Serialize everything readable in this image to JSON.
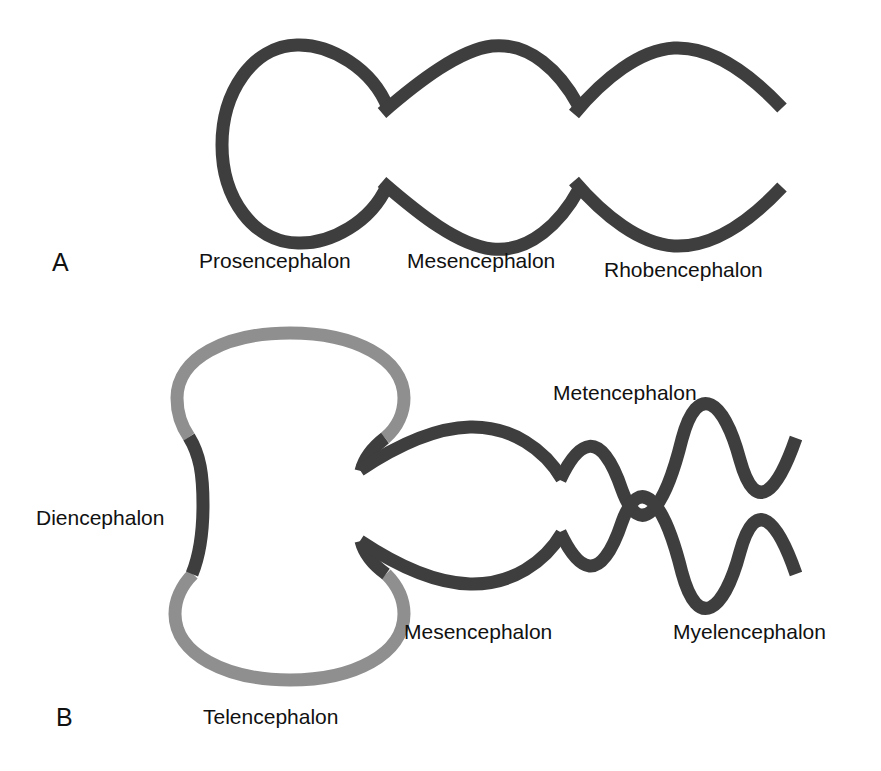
{
  "figure": {
    "background_color": "#ffffff",
    "title_visible": false
  },
  "colors": {
    "dark_stroke": "#3e3e3e",
    "light_stroke": "#8f8f8f",
    "text": "#111111"
  },
  "panels": [
    {
      "letter": "A",
      "letter_x": 52,
      "letter_y": 271,
      "stage": "three-vesicle stage",
      "labels": [
        {
          "text": "Prosencephalon",
          "x": 199,
          "y": 268,
          "color": "#111111"
        },
        {
          "text": "Mesencephalon",
          "x": 407,
          "y": 268,
          "color": "#111111"
        },
        {
          "text": "Rhobencephalon",
          "x": 604,
          "y": 277,
          "color": "#111111"
        }
      ]
    },
    {
      "letter": "B",
      "letter_x": 56,
      "letter_y": 726,
      "stage": "five-vesicle stage",
      "labels": [
        {
          "text": "Diencephalon",
          "x": 36,
          "y": 525,
          "color": "#111111"
        },
        {
          "text": "Telencephalon",
          "x": 203,
          "y": 724,
          "color": "#111111"
        },
        {
          "text": "Mesencephalon",
          "x": 404,
          "y": 639,
          "color": "#111111"
        },
        {
          "text": "Metencephalon",
          "x": 553,
          "y": 400,
          "color": "#111111"
        },
        {
          "text": "Myelencephalon",
          "x": 673,
          "y": 639,
          "color": "#111111"
        }
      ]
    }
  ],
  "structures": {
    "panel_a": [
      {
        "name": "prosencephalon",
        "color": "#3e3e3e",
        "stroke_width": 13
      },
      {
        "name": "mesencephalon",
        "color": "#3e3e3e",
        "stroke_width": 13
      },
      {
        "name": "rhombencephalon",
        "color": "#3e3e3e",
        "stroke_width": 13
      }
    ],
    "panel_b": [
      {
        "name": "telencephalon-upper",
        "color": "#8f8f8f",
        "stroke_width": 13
      },
      {
        "name": "telencephalon-lower",
        "color": "#8f8f8f",
        "stroke_width": 13
      },
      {
        "name": "diencephalon-upper",
        "color": "#3e3e3e",
        "stroke_width": 13
      },
      {
        "name": "diencephalon-lower",
        "color": "#3e3e3e",
        "stroke_width": 13
      },
      {
        "name": "mesencephalon-upper",
        "color": "#3e3e3e",
        "stroke_width": 13
      },
      {
        "name": "mesencephalon-lower",
        "color": "#3e3e3e",
        "stroke_width": 13
      },
      {
        "name": "metencephalon-myelencephalon-upper",
        "color": "#3e3e3e",
        "stroke_width": 13
      },
      {
        "name": "metencephalon-myelencephalon-lower",
        "color": "#3e3e3e",
        "stroke_width": 13
      }
    ]
  }
}
